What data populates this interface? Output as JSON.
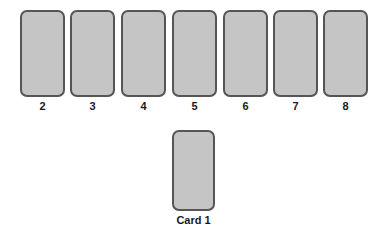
{
  "canvas": {
    "width": 387,
    "height": 238,
    "background_color": "#ffffff"
  },
  "style": {
    "card_fill": "#c5c5c5",
    "card_border": "#555555",
    "label_color": "#1a1a1a"
  },
  "top_row": {
    "count": 7,
    "start_x": 20,
    "spacing": 49,
    "card_width": 45,
    "card_height": 87,
    "cards": [
      {
        "label": "2",
        "x": 20
      },
      {
        "label": "3",
        "x": 70
      },
      {
        "label": "4",
        "x": 121
      },
      {
        "label": "5",
        "x": 172
      },
      {
        "label": "6",
        "x": 223
      },
      {
        "label": "7",
        "x": 273
      },
      {
        "label": "8",
        "x": 323
      }
    ]
  },
  "bottom_card": {
    "label": "Card 1",
    "x": 172,
    "y": 130,
    "width": 43,
    "height": 81
  }
}
